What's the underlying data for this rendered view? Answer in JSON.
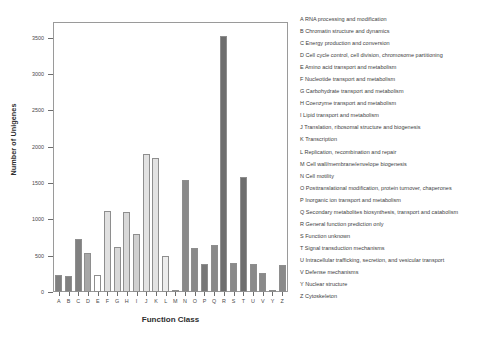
{
  "chart_data": {
    "type": "bar",
    "title": "",
    "xlabel": "Function Class",
    "ylabel": "Number of Unigenes",
    "ylim": [
      0,
      3700
    ],
    "yticks": [
      0,
      500,
      1000,
      1500,
      2000,
      2500,
      3000,
      3500
    ],
    "ytick_labels": [
      "0",
      "500",
      "1000",
      "1500",
      "2000",
      "2500",
      "3000",
      "3500"
    ],
    "grid": false,
    "legend_position": "right",
    "categories": [
      "A",
      "B",
      "C",
      "D",
      "E",
      "F",
      "G",
      "H",
      "I",
      "J",
      "K",
      "L",
      "M",
      "N",
      "O",
      "P",
      "Q",
      "R",
      "S",
      "T",
      "U",
      "V",
      "Y",
      "Z"
    ],
    "values": [
      240,
      225,
      730,
      530,
      235,
      1110,
      620,
      1100,
      800,
      1900,
      1850,
      490,
      30,
      1540,
      600,
      390,
      650,
      3520,
      400,
      1580,
      390,
      255,
      20,
      370
    ],
    "bar_colors": [
      "#808080",
      "#808080",
      "#808080",
      "#a8a8a8",
      "#ffffff",
      "#e0e0e0",
      "#d8d8d8",
      "#d8d8d8",
      "#d0d0d0",
      "#e2e2e2",
      "#e2e2e2",
      "#ededed",
      "#c8c8c8",
      "#8a8a8a",
      "#8a8a8a",
      "#787878",
      "#8a8a8a",
      "#6e6e6e",
      "#8a8a8a",
      "#6e6e6e",
      "#8a8a8a",
      "#8a8a8a",
      "#9a9a9a",
      "#8a8a8a"
    ],
    "axis_color": "#9a9a9a",
    "bar_edge_color": "#8e8e8e"
  },
  "legend": {
    "items": [
      "A  RNA processing and modification",
      "B  Chromatin structure and dynamics",
      "C  Energy production and conversion",
      "D  Cell cycle control, cell division, chromosome partitioning",
      "E  Amino acid transport and metabolism",
      "F  Nucleotide transport and metabolism",
      "G  Carbohydrate transport and metabolism",
      "H  Coenzyme transport and metabolism",
      "I  Lipid transport and metabolism",
      "J  Translation, ribosomal structure and biogenesis",
      "K  Transcription",
      "L  Replication, recombination and repair",
      "M  Cell wall/membrane/envelope biogenesis",
      "N  Cell motility",
      "O  Posttranslational modification, protein turnover, chaperones",
      "P  Inorganic ion transport and metabolism",
      "Q  Secondary metabolites biosynthesis, transport and catabolism",
      "R  General function prediction only",
      "S  Function unknown",
      "T  Signal transduction mechanisms",
      "U  Intracellular trafficking, secretion, and vesicular transport",
      "V  Defense mechanisms",
      "Y  Nuclear structure",
      "Z  Cytoskeleton"
    ]
  }
}
